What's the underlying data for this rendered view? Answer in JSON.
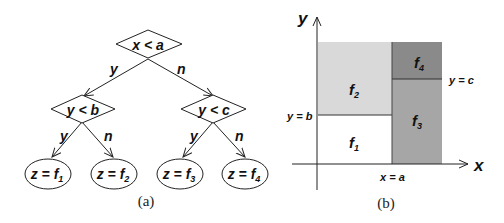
{
  "panel_a": {
    "caption": "(a)",
    "root": {
      "label": "x < a",
      "yes": "y",
      "no": "n"
    },
    "left": {
      "label": "y < b",
      "yes": "y",
      "no": "n"
    },
    "right": {
      "label": "y < c",
      "yes": "y",
      "no": "n"
    },
    "leaves": [
      {
        "prefix": "z = f",
        "sub": "1"
      },
      {
        "prefix": "z = f",
        "sub": "2"
      },
      {
        "prefix": "z = f",
        "sub": "3"
      },
      {
        "prefix": "z = f",
        "sub": "4"
      }
    ]
  },
  "panel_b": {
    "caption": "(b)",
    "x_axis_label": "x",
    "y_axis_label": "y",
    "lines": {
      "x_eq_a": "x = a",
      "y_eq_b": "y = b",
      "y_eq_c": "y = c"
    },
    "regions": [
      {
        "name": "f",
        "sub": "1",
        "color": "#ffffff"
      },
      {
        "name": "f",
        "sub": "2",
        "color": "#d9d9d9"
      },
      {
        "name": "f",
        "sub": "3",
        "color": "#a6a6a6"
      },
      {
        "name": "f",
        "sub": "4",
        "color": "#8a8a8a"
      }
    ]
  }
}
